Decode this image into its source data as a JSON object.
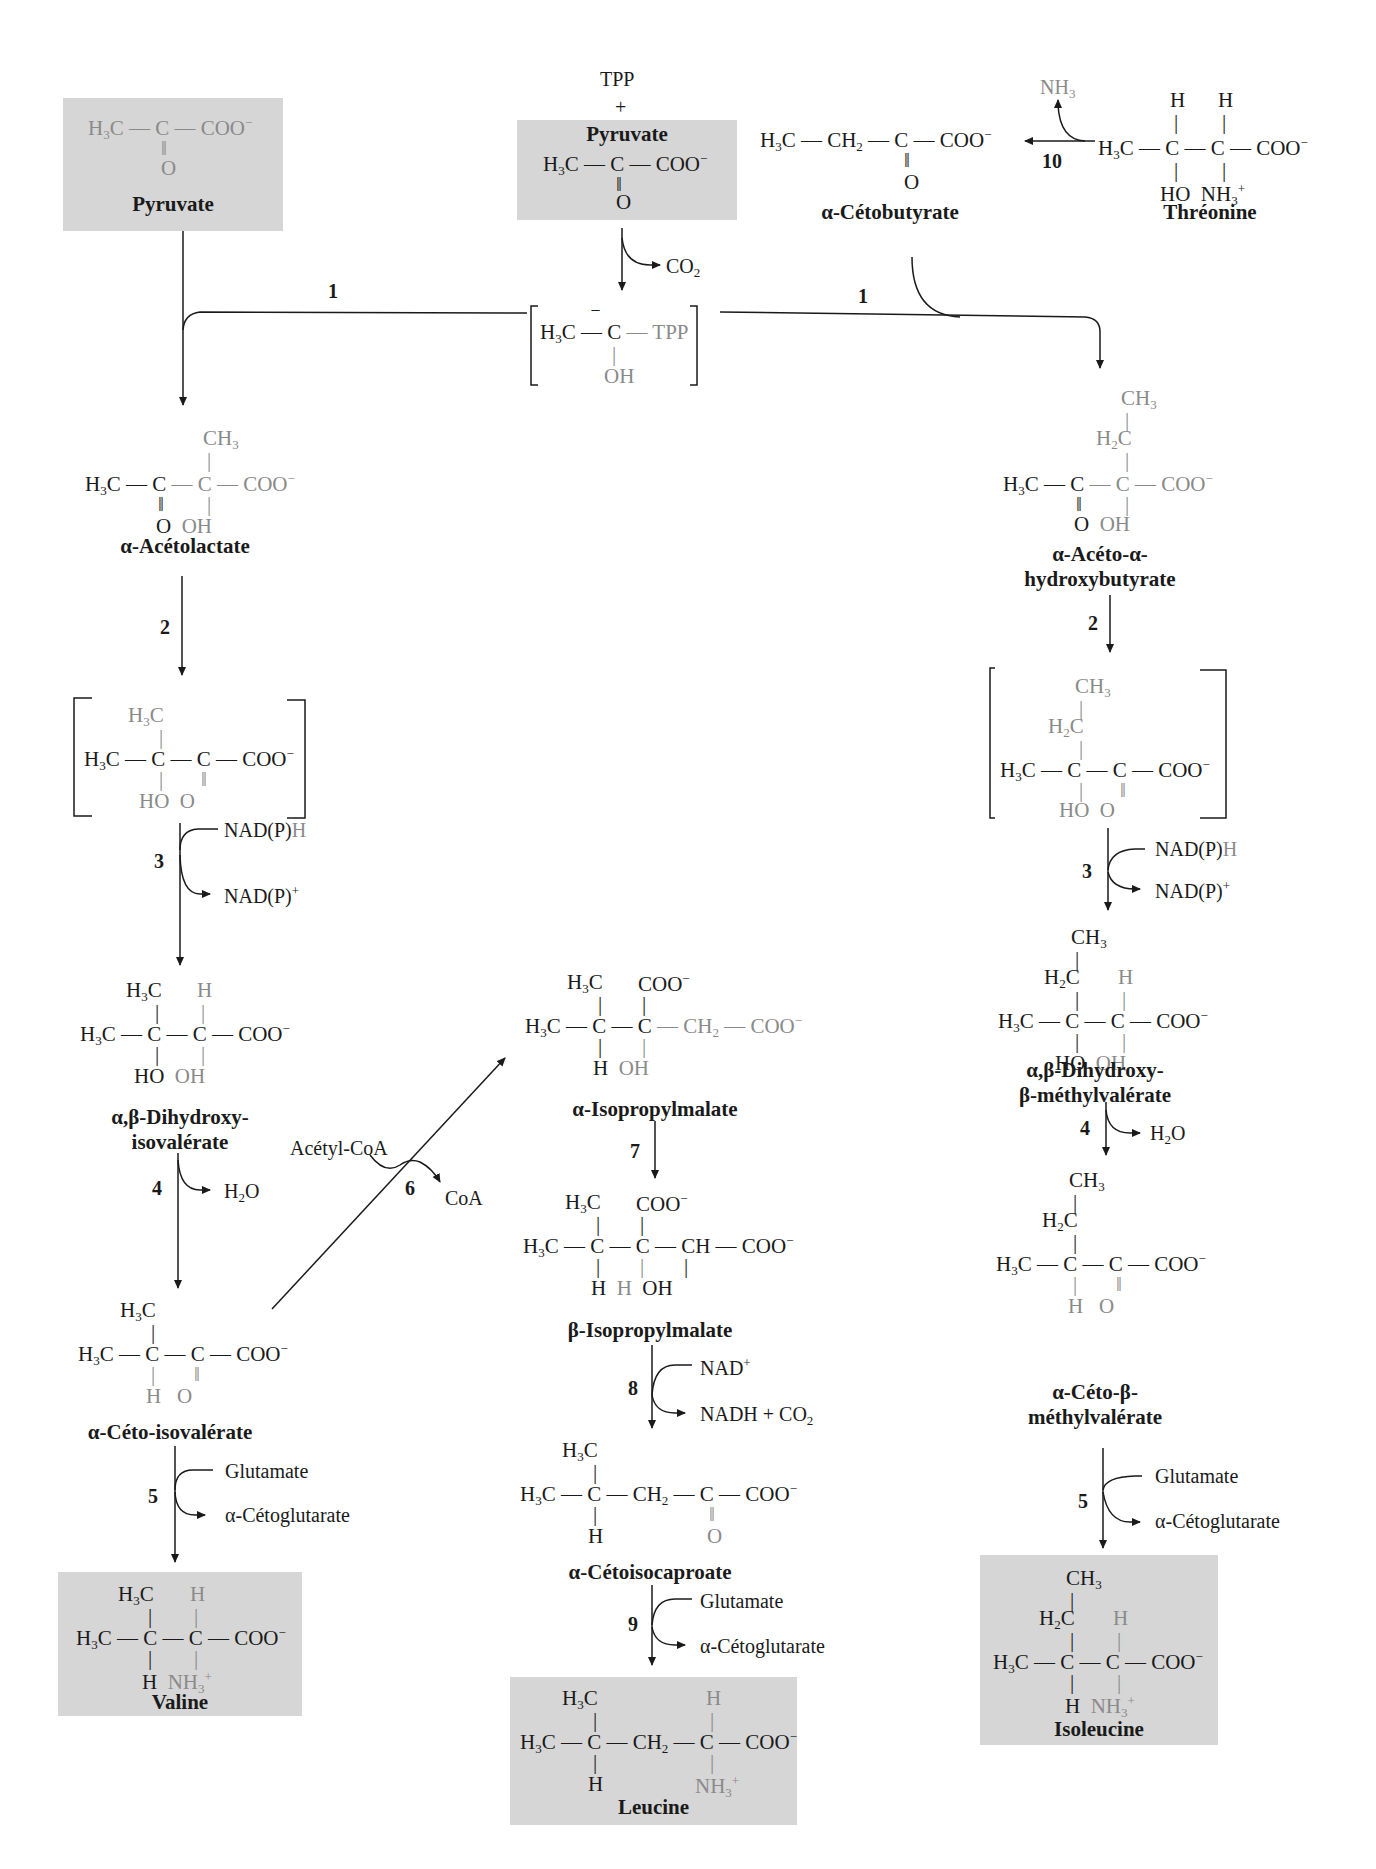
{
  "colors": {
    "box_bg": "#d6d6d6",
    "highlight_gray": "#8a8a8a",
    "ink": "#1a1a1a"
  },
  "top": {
    "pyruvate_left": {
      "name": "Pyruvate",
      "formula": "H3C—C(=O)—COO⁻"
    },
    "tpp": "TPP",
    "plus": "+",
    "pyruvate_center": {
      "name": "Pyruvate",
      "formula": "H3C—C(=O)—COO⁻"
    },
    "co2": "CO2",
    "tpp_intermediate": {
      "formula": "[H3C—C̄(OH)—TPP]",
      "tpp_label": "TPP",
      "oh": "OH"
    },
    "cetobutyrate": {
      "name": "α-Cétobutyrate",
      "formula": "H3C—CH2—C(=O)—COO⁻"
    },
    "threonine": {
      "name": "Thréonine",
      "formula": "H3C—CH(OH)—CH(NH3⁺)—COO⁻"
    },
    "nh3": "NH3",
    "step10": "10",
    "step1_left": "1",
    "step1_right": "1"
  },
  "valine_pathway": {
    "acetolactate": {
      "name": "α-Acétolactate"
    },
    "step2": "2",
    "intermediate_bracket": {
      "name": ""
    },
    "step3": "3",
    "step3_in": "NAD(P)H",
    "step3_out": "NAD(P)+",
    "dihydroxy": {
      "name_line1": "α,β-Dihydroxy-",
      "name_line2": "isovalérate"
    },
    "step4": "4",
    "step4_out": "H2O",
    "cetoisovalerate": {
      "name": "α-Céto-isovalérate"
    },
    "step5": "5",
    "step5_in": "Glutamate",
    "step5_out": "α-Cétoglutarate",
    "valine": {
      "name": "Valine"
    }
  },
  "leucine_pathway": {
    "step6": "6",
    "step6_in": "Acétyl-CoA",
    "step6_out": "CoA",
    "alpha_ipm": {
      "name": "α-Isopropylmalate"
    },
    "step7": "7",
    "beta_ipm": {
      "name": "β-Isopropylmalate"
    },
    "step8": "8",
    "step8_in": "NAD+",
    "step8_out": "NADH + CO2",
    "cetoisocaproate": {
      "name": "α-Cétoisocaproate"
    },
    "step9": "9",
    "step9_in": "Glutamate",
    "step9_out": "α-Cétoglutarate",
    "leucine": {
      "name": "Leucine"
    }
  },
  "isoleucine_pathway": {
    "aceto_hydroxybutyrate": {
      "name_line1": "α-Acéto-α-",
      "name_line2": "hydroxybutyrate"
    },
    "step2": "2",
    "step3": "3",
    "step3_in": "NAD(P)H",
    "step3_out": "NAD(P)+",
    "dihydroxy_methylvalerate": {
      "name_line1": "α,β-Dihydroxy-",
      "name_line2": "β-méthylvalérate"
    },
    "step4": "4",
    "step4_out": "H2O",
    "ceto_methylvalerate": {
      "name_line1": "α-Céto-β-",
      "name_line2": "méthylvalérate"
    },
    "step5": "5",
    "step5_in": "Glutamate",
    "step5_out": "α-Cétoglutarate",
    "isoleucine": {
      "name": "Isoleucine"
    }
  }
}
